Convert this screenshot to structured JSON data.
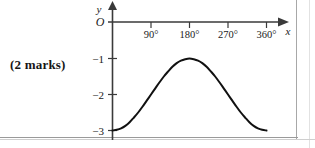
{
  "question": {
    "marks_label": "(2 marks)"
  },
  "chart_data": {
    "type": "line",
    "title": "",
    "subtitle": "",
    "xlabel": "x",
    "ylabel": "y",
    "origin_label": "O",
    "grid": false,
    "legend": null,
    "annotations": [],
    "xlim": [
      0,
      390
    ],
    "ylim": [
      -3.35,
      0.35
    ],
    "x_tick_labels": [
      "90°",
      "180°",
      "270°",
      "360°"
    ],
    "x_tick_values": [
      90,
      180,
      270,
      360
    ],
    "y_tick_labels": [
      "−1",
      "−2",
      "−3"
    ],
    "y_tick_values": [
      -1,
      -2,
      -3
    ],
    "series": [
      {
        "name": "y = -2 + cos(x)",
        "x": [
          0,
          10,
          20,
          30,
          40,
          50,
          60,
          70,
          80,
          90,
          100,
          110,
          120,
          130,
          140,
          150,
          160,
          170,
          180,
          190,
          200,
          210,
          220,
          230,
          240,
          250,
          260,
          270,
          280,
          290,
          300,
          310,
          320,
          330,
          340,
          350,
          360
        ],
        "values": [
          -3.0,
          -2.98,
          -2.94,
          -2.87,
          -2.77,
          -2.64,
          -2.5,
          -2.34,
          -2.17,
          -2.0,
          -1.83,
          -1.66,
          -1.5,
          -1.36,
          -1.23,
          -1.13,
          -1.06,
          -1.02,
          -1.0,
          -1.02,
          -1.06,
          -1.13,
          -1.23,
          -1.36,
          -1.5,
          -1.66,
          -1.83,
          -2.0,
          -2.17,
          -2.34,
          -2.5,
          -2.64,
          -2.77,
          -2.87,
          -2.94,
          -2.98,
          -3.0
        ]
      }
    ],
    "curve_color": "#111111",
    "axis_color": "#3a3a3a"
  }
}
